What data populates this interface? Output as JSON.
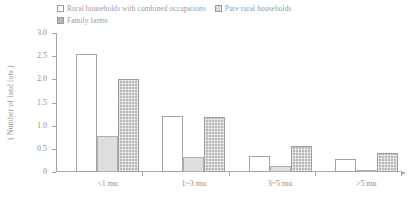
{
  "legend": {
    "entries": [
      {
        "label": "Rural households with combined occupations",
        "swatch": "white-square-icon"
      },
      {
        "label": "Pure rural households",
        "swatch": "light-gray-square-icon"
      },
      {
        "label": "Family farms",
        "swatch": "dark-gray-square-icon"
      }
    ]
  },
  "axes": {
    "ylabel": "( Number of land lots )",
    "yticks": [
      "0",
      "0.5",
      "1.0",
      "1.5",
      "2.0",
      "2.5",
      "3.0"
    ]
  },
  "colors": {
    "series_white": "#ffffff",
    "series_light": "#dedede",
    "series_dark": "#b9b9b9",
    "axis": "#a6a6a6",
    "text": "#8f8f8f"
  },
  "chart_data": {
    "type": "bar",
    "title": "",
    "xlabel": "",
    "ylabel": "( Number of land lots )",
    "categories": [
      "<1 mu",
      "1~3 mu",
      "3~5 mu",
      ">5 mu"
    ],
    "series": [
      {
        "name": "Rural households with combined occupations",
        "values": [
          2.55,
          1.2,
          0.35,
          0.28
        ]
      },
      {
        "name": "Pure rural households",
        "values": [
          0.78,
          0.33,
          0.12,
          0.03
        ]
      },
      {
        "name": "Family farms",
        "values": [
          2.0,
          1.18,
          0.57,
          0.4
        ]
      }
    ],
    "ylim": [
      0,
      3.0
    ],
    "ytick_step": 0.5,
    "grid": false,
    "legend_position": "top"
  }
}
